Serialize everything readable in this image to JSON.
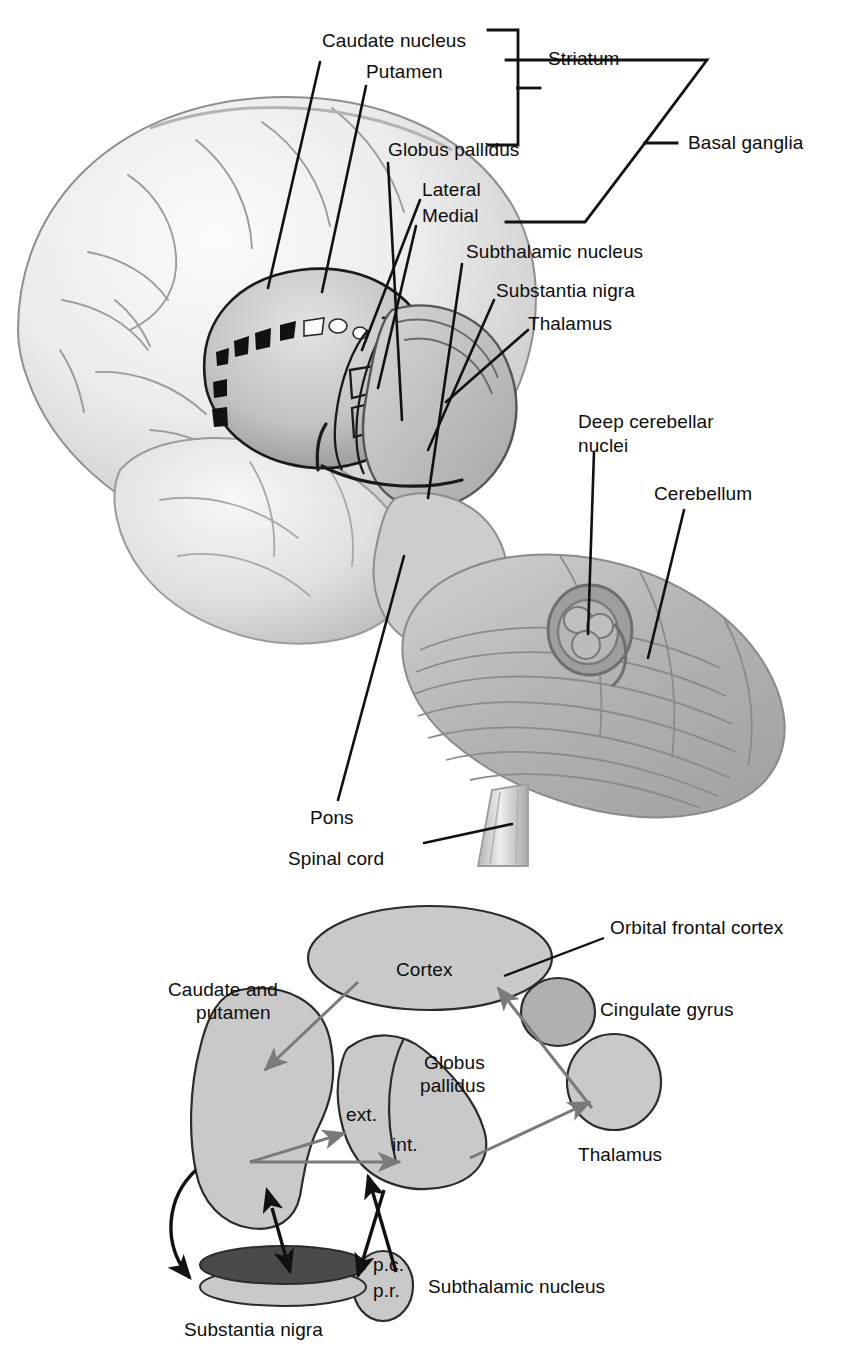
{
  "figure": {
    "panels": [
      {
        "id": "top",
        "name": "brain-anatomy-illustration",
        "labels": [
          {
            "key": "caudate_nucleus",
            "text": "Caudate nucleus"
          },
          {
            "key": "putamen",
            "text": "Putamen"
          },
          {
            "key": "striatum",
            "text": "Striatum"
          },
          {
            "key": "basal_ganglia",
            "text": "Basal ganglia"
          },
          {
            "key": "globus_pallidus",
            "text": "Globus pallidus"
          },
          {
            "key": "lateral",
            "text": "Lateral"
          },
          {
            "key": "medial",
            "text": "Medial"
          },
          {
            "key": "subthalamic_nucleus",
            "text": "Subthalamic nucleus"
          },
          {
            "key": "substantia_nigra",
            "text": "Substantia nigra"
          },
          {
            "key": "thalamus",
            "text": "Thalamus"
          },
          {
            "key": "deep_cerebellar_nuclei_line1",
            "text": "Deep cerebellar"
          },
          {
            "key": "deep_cerebellar_nuclei_line2",
            "text": "nuclei"
          },
          {
            "key": "cerebellum",
            "text": "Cerebellum"
          },
          {
            "key": "pons",
            "text": "Pons"
          },
          {
            "key": "spinal_cord",
            "text": "Spinal cord"
          }
        ]
      },
      {
        "id": "bottom",
        "name": "basal-ganglia-circuit-schematic",
        "labels": [
          {
            "key": "orbital_frontal_cortex",
            "text": "Orbital frontal cortex"
          },
          {
            "key": "cortex",
            "text": "Cortex"
          },
          {
            "key": "caudate_and_putamen_line1",
            "text": "Caudate and"
          },
          {
            "key": "caudate_and_putamen_line2",
            "text": "putamen"
          },
          {
            "key": "cingulate_gyrus",
            "text": "Cingulate gyrus"
          },
          {
            "key": "globus_pallidus_line1",
            "text": "Globus"
          },
          {
            "key": "globus_pallidus_line2",
            "text": "pallidus"
          },
          {
            "key": "ext",
            "text": "ext."
          },
          {
            "key": "int",
            "text": "int."
          },
          {
            "key": "thalamus",
            "text": "Thalamus"
          },
          {
            "key": "subthalamic_nucleus",
            "text": "Subthalamic nucleus"
          },
          {
            "key": "pc",
            "text": "p.c."
          },
          {
            "key": "pr",
            "text": "p.r."
          },
          {
            "key": "substantia_nigra",
            "text": "Substantia nigra"
          }
        ]
      }
    ]
  },
  "colors": {
    "background": "#ffffff",
    "text": "#0d0d0d",
    "leader_line": "#111111",
    "shape_fill_light": "#c9c9c9",
    "shape_fill_mid": "#b0b0b0",
    "shape_outline": "#2b2b2b",
    "arrow_gray": "#7a7a7a",
    "arrow_black": "#111111",
    "substantia_nigra_pc": "#4a4a4a",
    "substantia_nigra_pr": "#c9c9c9",
    "brain_light": "#ededed",
    "brain_mid": "#cfcfcf",
    "brain_dark": "#9a9a9a",
    "cerebellum": "#b9b9b9"
  },
  "top_labels": {
    "caudate_nucleus": "Caudate nucleus",
    "putamen": "Putamen",
    "striatum": "Striatum",
    "basal_ganglia": "Basal ganglia",
    "globus_pallidus": "Globus pallidus",
    "lateral": "Lateral",
    "medial": "Medial",
    "subthalamic_nucleus": "Subthalamic nucleus",
    "substantia_nigra": "Substantia nigra",
    "thalamus": "Thalamus",
    "deep_cerebellar_nuclei": "Deep cerebellar\nnuclei",
    "deep_cerebellar_l1": "Deep cerebellar",
    "deep_cerebellar_l2": "nuclei",
    "cerebellum": "Cerebellum",
    "pons": "Pons",
    "spinal_cord": "Spinal cord"
  },
  "bottom_labels": {
    "orbital_frontal_cortex": "Orbital frontal cortex",
    "cortex": "Cortex",
    "caudate_putamen_l1": "Caudate and",
    "caudate_putamen_l2": "putamen",
    "cingulate_gyrus": "Cingulate gyrus",
    "globus_pallidus_l1": "Globus",
    "globus_pallidus_l2": "pallidus",
    "ext": "ext.",
    "int": "int.",
    "thalamus": "Thalamus",
    "subthalamic_nucleus": "Subthalamic nucleus",
    "pc": "p.c.",
    "pr": "p.r.",
    "substantia_nigra": "Substantia nigra"
  }
}
